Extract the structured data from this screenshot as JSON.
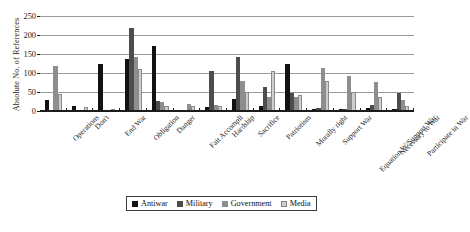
{
  "chart_data": {
    "type": "bar",
    "title": "",
    "xlabel": "",
    "ylabel": "Absolute No. of References",
    "ylim": [
      0,
      250
    ],
    "yticks": [
      0,
      50,
      100,
      150,
      200,
      250
    ],
    "grid": true,
    "legend_position": "bottom",
    "categories": [
      "Operations",
      "Don't",
      "End War",
      "Obligation",
      "Danger",
      "Fait Accompli",
      "Hardship",
      "Sacrifice",
      "Patriotism",
      "Morally right",
      "Support War",
      "Equation W/Support War",
      "Necessary to War",
      "Participate in War"
    ],
    "series": [
      {
        "name": "Antiwar",
        "color": "#121212",
        "values": [
          28,
          14,
          124,
          138,
          172,
          0,
          10,
          32,
          14,
          123,
          5,
          4,
          8,
          6
        ]
      },
      {
        "name": "Military",
        "color": "#4d4d4d",
        "values": [
          0,
          0,
          0,
          218,
          26,
          0,
          105,
          143,
          63,
          48,
          8,
          5,
          15,
          48
        ]
      },
      {
        "name": "Government",
        "color": "#8e8e8e",
        "values": [
          118,
          3,
          0,
          141,
          24,
          19,
          17,
          78,
          38,
          36,
          113,
          92,
          76,
          28
        ]
      },
      {
        "name": "Media",
        "color": "#cfcfcf",
        "values": [
          46,
          11,
          0,
          111,
          14,
          13,
          12,
          50,
          105,
          41,
          78,
          50,
          37,
          13
        ]
      }
    ]
  },
  "axis": {
    "y_title": "Absolute No. of References"
  },
  "legend": {
    "items": [
      {
        "label": "Antiwar"
      },
      {
        "label": "Military"
      },
      {
        "label": "Government"
      },
      {
        "label": "Media"
      }
    ]
  }
}
